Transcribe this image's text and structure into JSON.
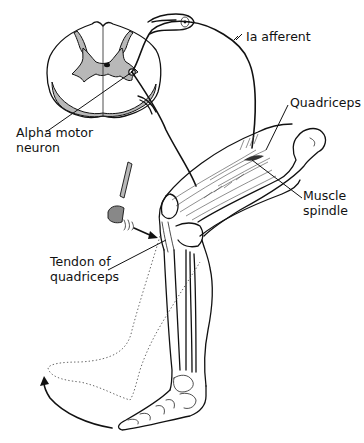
{
  "figure": {
    "labels": {
      "ia_afferent": "Ia afferent",
      "quadriceps": "Quadriceps",
      "muscle_spindle_line1": "Muscle",
      "muscle_spindle_line2": "spindle",
      "alpha_motor_line1": "Alpha motor",
      "alpha_motor_line2": "neuron",
      "tendon_line1": "Tendon of",
      "tendon_line2": "quadriceps"
    },
    "colors": {
      "ink": "#111111",
      "grey_matter": "#b8b8b8",
      "background": "#ffffff"
    }
  }
}
